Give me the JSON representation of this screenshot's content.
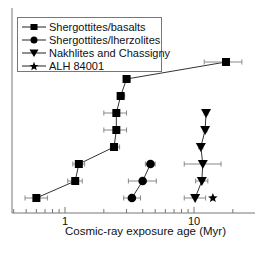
{
  "chart_data": {
    "type": "scatter",
    "title": "",
    "xlabel": "Cosmic-ray exposure age (Myr)",
    "ylabel": "",
    "xscale": "log",
    "xlim": [
      0.39,
      30
    ],
    "xticks_major": [
      1,
      10
    ],
    "xtick_labels": [
      "1",
      "10"
    ],
    "grid": false,
    "legend_position": "upper left",
    "series": [
      {
        "name": "Shergottites/basalts",
        "marker": "square",
        "connected": true,
        "points": [
          {
            "x": 0.6,
            "row": 1,
            "xerr": [
              0.49,
              0.73
            ]
          },
          {
            "x": 1.2,
            "row": 2,
            "xerr": [
              1.05,
              1.36
            ]
          },
          {
            "x": 1.28,
            "row": 3,
            "xerr": [
              1.15,
              1.42
            ]
          },
          {
            "x": 2.4,
            "row": 4,
            "xerr": [
              2.25,
              2.65
            ]
          },
          {
            "x": 2.5,
            "row": 5,
            "xerr": [
              2.0,
              3.0
            ]
          },
          {
            "x": 2.5,
            "row": 6,
            "xerr": [
              2.0,
              3.0
            ]
          },
          {
            "x": 2.7,
            "row": 7,
            "xerr": [
              2.55,
              2.9
            ]
          },
          {
            "x": 3.0,
            "row": 8,
            "xerr": [
              2.85,
              3.2
            ]
          },
          {
            "x": 17.7,
            "row": 9,
            "xerr": [
              12.0,
              23.5
            ]
          }
        ]
      },
      {
        "name": "Shergottites/lherzolites",
        "marker": "circle",
        "connected": true,
        "points": [
          {
            "x": 3.3,
            "row": 1,
            "xerr": [
              2.85,
              3.85
            ]
          },
          {
            "x": 4.0,
            "row": 2,
            "xerr": [
              3.1,
              5.1
            ]
          },
          {
            "x": 4.6,
            "row": 3,
            "xerr": [
              4.2,
              5.0
            ]
          }
        ]
      },
      {
        "name": "Nakhlites and Chassigny",
        "marker": "triangle-down",
        "connected": true,
        "points": [
          {
            "x": 10.2,
            "row": 1,
            "xerr": [
              8.4,
              12.3
            ]
          },
          {
            "x": 11.5,
            "row": 2,
            "xerr": [
              10.3,
              12.8
            ]
          },
          {
            "x": 11.7,
            "row": 3,
            "xerr": [
              8.4,
              16.2
            ]
          },
          {
            "x": 11.3,
            "row": 4,
            "xerr": [
              10.9,
              11.7
            ]
          },
          {
            "x": 12.2,
            "row": 5,
            "xerr": [
              11.8,
              12.6
            ]
          },
          {
            "x": 12.4,
            "row": 6,
            "xerr": [
              12.0,
              12.8
            ]
          }
        ]
      },
      {
        "name": "ALH 84001",
        "marker": "star",
        "connected": false,
        "points": [
          {
            "x": 14.0,
            "row": 1,
            "xerr": null
          }
        ]
      }
    ]
  },
  "legend": {
    "items": [
      {
        "label": "Shergottites/basalts",
        "marker": "square"
      },
      {
        "label": "Shergottites/lherzolites",
        "marker": "circle"
      },
      {
        "label": "Nakhlites and Chassigny",
        "marker": "triangle-down"
      },
      {
        "label": "ALH 84001",
        "marker": "star"
      }
    ]
  },
  "axis": {
    "xlabel": "Cosmic-ray exposure age (Myr)",
    "tick_1": "1",
    "tick_10": "10"
  },
  "colors": {
    "marker": "#000000",
    "line": "#333333",
    "errorbar": "#888888",
    "axis": "#777777"
  }
}
